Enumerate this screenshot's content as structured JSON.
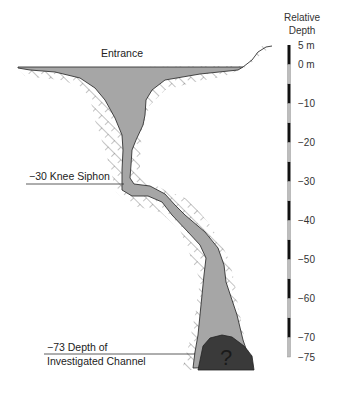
{
  "diagram": {
    "title_scale": {
      "line1": "Relative",
      "line2": "Depth"
    },
    "labels": {
      "entrance": "Entrance",
      "knee_siphon": "−30 Knee Siphon",
      "investigated_line1": "−73 Depth of",
      "investigated_line2": "Investigated Channel",
      "unknown_mark": "?"
    },
    "scale": {
      "unit": "m",
      "min": -75,
      "max": 5,
      "segment_step": 5,
      "ticks": [
        {
          "value": 5,
          "label": "5 m"
        },
        {
          "value": 0,
          "label": "0 m"
        },
        {
          "value": -10,
          "label": "−10"
        },
        {
          "value": -20,
          "label": "−20"
        },
        {
          "value": -30,
          "label": "−30"
        },
        {
          "value": -40,
          "label": "−40"
        },
        {
          "value": -50,
          "label": "−50"
        },
        {
          "value": -60,
          "label": "−60"
        },
        {
          "value": -70,
          "label": "−70"
        },
        {
          "value": -75,
          "label": "−75"
        }
      ]
    },
    "features": {
      "knee_siphon_depth": -30,
      "investigated_depth": -73
    },
    "colors": {
      "water": "#a6a6a6",
      "sediment": "#3a3a3a",
      "rock_hatch": "#777777",
      "outline": "#333333",
      "scale_dark": "#111111",
      "scale_light": "#bdbdbd"
    }
  }
}
